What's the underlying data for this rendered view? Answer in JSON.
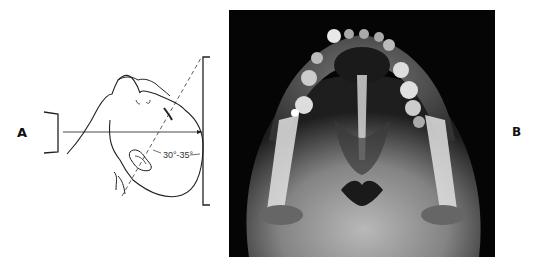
{
  "figure": {
    "panel_a": {
      "label": "A",
      "angle_annotation": "30°-35°",
      "description": "Line drawing of head tilted back with central ray at 30°-35° angle"
    },
    "panel_b": {
      "label": "B",
      "description": "Radiograph of submentovertical skull view showing mandible and teeth"
    }
  },
  "colors": {
    "line": "#222222",
    "xray_bg": "#050505"
  }
}
